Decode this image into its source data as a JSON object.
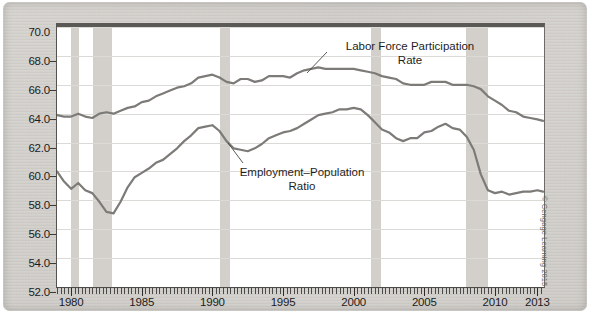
{
  "figure": {
    "credit": "© Cengage Learning 2015"
  },
  "annotations": {
    "lfpr_line1": "Labor Force Participation",
    "lfpr_line2": "Rate",
    "epop_line1": "Employment–Population",
    "epop_line2": "Ratio"
  },
  "chart_data": {
    "type": "line",
    "title": "",
    "xlabel": "",
    "ylabel": "",
    "xlim": [
      1979.0,
      2013.4
    ],
    "ylim": [
      52.0,
      70.0
    ],
    "grid": true,
    "legend": "inline-annotations",
    "y_ticks": [
      "52.0",
      "54.0",
      "56.0",
      "58.0",
      "60.0",
      "62.0",
      "64.0",
      "66.0",
      "68.0",
      "70.0"
    ],
    "y_tick_values": [
      52.0,
      54.0,
      56.0,
      58.0,
      60.0,
      62.0,
      64.0,
      66.0,
      68.0,
      70.0
    ],
    "x_ticks": [
      "1980",
      "1985",
      "1990",
      "1995",
      "2000",
      "2005",
      "2010",
      "2013"
    ],
    "x_tick_values": [
      1980,
      1985,
      1990,
      1995,
      2000,
      2005,
      2010,
      2013
    ],
    "line_color": "#7d7b78",
    "recession_band_color": "#d3d0cb",
    "recession_bands": [
      {
        "start": 1980.0,
        "end": 1980.55
      },
      {
        "start": 1981.55,
        "end": 1982.92
      },
      {
        "start": 1990.55,
        "end": 1991.25
      },
      {
        "start": 2001.2,
        "end": 2001.92
      },
      {
        "start": 2007.95,
        "end": 2009.5
      }
    ],
    "series": [
      {
        "name": "Labor Force Participation Rate",
        "x": [
          1979.0,
          1979.5,
          1980.0,
          1980.5,
          1981.0,
          1981.5,
          1982.0,
          1982.5,
          1983.0,
          1983.5,
          1984.0,
          1984.5,
          1985.0,
          1985.5,
          1986.0,
          1986.5,
          1987.0,
          1987.5,
          1988.0,
          1988.5,
          1989.0,
          1989.5,
          1990.0,
          1990.5,
          1991.0,
          1991.5,
          1992.0,
          1992.5,
          1993.0,
          1993.5,
          1994.0,
          1994.5,
          1995.0,
          1995.5,
          1996.0,
          1996.5,
          1997.0,
          1997.5,
          1998.0,
          1998.5,
          1999.0,
          1999.5,
          2000.0,
          2000.5,
          2001.0,
          2001.5,
          2002.0,
          2002.5,
          2003.0,
          2003.5,
          2004.0,
          2004.5,
          2005.0,
          2005.5,
          2006.0,
          2006.5,
          2007.0,
          2007.5,
          2008.0,
          2008.5,
          2009.0,
          2009.5,
          2010.0,
          2010.5,
          2011.0,
          2011.5,
          2012.0,
          2012.5,
          2013.0,
          2013.4
        ],
        "y": [
          63.9,
          63.8,
          63.8,
          64.0,
          63.8,
          63.7,
          64.0,
          64.1,
          64.0,
          64.2,
          64.4,
          64.5,
          64.8,
          64.9,
          65.2,
          65.4,
          65.6,
          65.8,
          65.9,
          66.1,
          66.5,
          66.6,
          66.7,
          66.5,
          66.2,
          66.1,
          66.4,
          66.4,
          66.2,
          66.3,
          66.6,
          66.6,
          66.6,
          66.5,
          66.8,
          67.0,
          67.1,
          67.2,
          67.1,
          67.1,
          67.1,
          67.1,
          67.1,
          67.0,
          66.9,
          66.8,
          66.6,
          66.5,
          66.4,
          66.1,
          66.0,
          66.0,
          66.0,
          66.2,
          66.2,
          66.2,
          66.0,
          66.0,
          66.0,
          65.9,
          65.7,
          65.2,
          64.9,
          64.6,
          64.2,
          64.1,
          63.8,
          63.7,
          63.6,
          63.5
        ]
      },
      {
        "name": "Employment-Population Ratio",
        "x": [
          1979.0,
          1979.5,
          1980.0,
          1980.5,
          1981.0,
          1981.5,
          1982.0,
          1982.5,
          1983.0,
          1983.5,
          1984.0,
          1984.5,
          1985.0,
          1985.5,
          1986.0,
          1986.5,
          1987.0,
          1987.5,
          1988.0,
          1988.5,
          1989.0,
          1989.5,
          1990.0,
          1990.5,
          1991.0,
          1991.5,
          1992.0,
          1992.5,
          1993.0,
          1993.5,
          1994.0,
          1994.5,
          1995.0,
          1995.5,
          1996.0,
          1996.5,
          1997.0,
          1997.5,
          1998.0,
          1998.5,
          1999.0,
          1999.5,
          2000.0,
          2000.5,
          2001.0,
          2001.5,
          2002.0,
          2002.5,
          2003.0,
          2003.5,
          2004.0,
          2004.5,
          2005.0,
          2005.5,
          2006.0,
          2006.5,
          2007.0,
          2007.5,
          2008.0,
          2008.5,
          2009.0,
          2009.5,
          2010.0,
          2010.5,
          2011.0,
          2011.5,
          2012.0,
          2012.5,
          2013.0,
          2013.4
        ],
        "y": [
          60.0,
          59.3,
          58.8,
          59.2,
          58.7,
          58.5,
          57.9,
          57.2,
          57.1,
          57.9,
          58.9,
          59.6,
          59.9,
          60.2,
          60.6,
          60.8,
          61.2,
          61.6,
          62.1,
          62.5,
          63.0,
          63.1,
          63.2,
          62.8,
          62.1,
          61.6,
          61.5,
          61.4,
          61.6,
          61.9,
          62.3,
          62.5,
          62.7,
          62.8,
          63.0,
          63.3,
          63.6,
          63.9,
          64.0,
          64.1,
          64.3,
          64.3,
          64.4,
          64.3,
          63.9,
          63.4,
          62.9,
          62.7,
          62.3,
          62.1,
          62.3,
          62.3,
          62.7,
          62.8,
          63.1,
          63.3,
          63.0,
          62.9,
          62.4,
          61.5,
          59.8,
          58.7,
          58.5,
          58.6,
          58.4,
          58.5,
          58.6,
          58.6,
          58.7,
          58.6
        ]
      }
    ]
  }
}
